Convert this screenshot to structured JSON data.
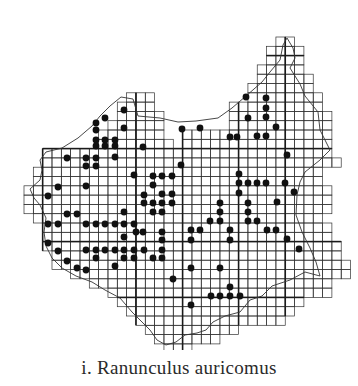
{
  "figure": {
    "caption": "i. Ranunculus auricomus",
    "ink_color": "#1a1a1a",
    "grid_color": "#333333",
    "dot_color": "#111111"
  },
  "grid": {
    "cell_w": 9.33,
    "cell_h": 9.3,
    "origin_x": 24,
    "origin_y": 37,
    "rows": [
      [
        [
          27,
          28
        ]
      ],
      [
        [
          26,
          29
        ]
      ],
      [
        [
          26,
          29
        ]
      ],
      [
        [
          25,
          29
        ]
      ],
      [
        [
          25,
          30
        ]
      ],
      [
        [
          24,
          30
        ]
      ],
      [
        [
          11,
          13
        ],
        [
          24,
          31
        ]
      ],
      [
        [
          10,
          13
        ],
        [
          22,
          31
        ]
      ],
      [
        [
          10,
          14
        ],
        [
          22,
          32
        ]
      ],
      [
        [
          9,
          14
        ],
        [
          22,
          32
        ]
      ],
      [
        [
          8,
          14
        ],
        [
          17,
          32
        ]
      ],
      [
        [
          8,
          15
        ],
        [
          17,
          32
        ]
      ],
      [
        [
          2,
          32
        ]
      ],
      [
        [
          2,
          33
        ]
      ],
      [
        [
          1,
          31
        ]
      ],
      [
        [
          1,
          31
        ]
      ],
      [
        [
          0,
          32
        ]
      ],
      [
        [
          0,
          32
        ]
      ],
      [
        [
          0,
          32
        ]
      ],
      [
        [
          1,
          31
        ]
      ],
      [
        [
          2,
          32
        ]
      ],
      [
        [
          2,
          32
        ]
      ],
      [
        [
          2,
          33
        ]
      ],
      [
        [
          3,
          33
        ]
      ],
      [
        [
          3,
          34
        ]
      ],
      [
        [
          5,
          34
        ]
      ],
      [
        [
          7,
          32
        ]
      ],
      [
        [
          9,
          32
        ]
      ],
      [
        [
          10,
          29
        ]
      ],
      [
        [
          11,
          28
        ]
      ],
      [
        [
          12,
          27
        ]
      ],
      [
        [
          13,
          22
        ]
      ],
      [
        [
          14,
          20
        ]
      ],
      [
        [
          15,
          17
        ]
      ]
    ],
    "bold_cols": [
      2,
      12,
      17,
      23,
      28
    ],
    "bold_rows": [
      2,
      12,
      22,
      28
    ]
  },
  "dots": [
    [
      246,
      97
    ],
    [
      266,
      98
    ],
    [
      266,
      108
    ],
    [
      266,
      117
    ],
    [
      248,
      118
    ],
    [
      276,
      127
    ],
    [
      257,
      136
    ],
    [
      266,
      136
    ],
    [
      230,
      137
    ],
    [
      237,
      137
    ],
    [
      287,
      155
    ],
    [
      182,
      129
    ],
    [
      200,
      128
    ],
    [
      124,
      110
    ],
    [
      105,
      118
    ],
    [
      96,
      123
    ],
    [
      124,
      128
    ],
    [
      96,
      130
    ],
    [
      96,
      140
    ],
    [
      105,
      140
    ],
    [
      115,
      140
    ],
    [
      96,
      146
    ],
    [
      105,
      146
    ],
    [
      115,
      146
    ],
    [
      115,
      157
    ],
    [
      143,
      147
    ],
    [
      86,
      158
    ],
    [
      96,
      158
    ],
    [
      67,
      158
    ],
    [
      86,
      166
    ],
    [
      96,
      166
    ],
    [
      134,
      175
    ],
    [
      153,
      176
    ],
    [
      162,
      176
    ],
    [
      172,
      176
    ],
    [
      153,
      185
    ],
    [
      144,
      195
    ],
    [
      162,
      194
    ],
    [
      172,
      194
    ],
    [
      144,
      203
    ],
    [
      153,
      203
    ],
    [
      162,
      203
    ],
    [
      172,
      203
    ],
    [
      153,
      212
    ],
    [
      162,
      212
    ],
    [
      181,
      165
    ],
    [
      58,
      187
    ],
    [
      48,
      196
    ],
    [
      86,
      186
    ],
    [
      67,
      214
    ],
    [
      77,
      214
    ],
    [
      48,
      224
    ],
    [
      58,
      224
    ],
    [
      86,
      224
    ],
    [
      96,
      224
    ],
    [
      105,
      224
    ],
    [
      115,
      224
    ],
    [
      124,
      224
    ],
    [
      134,
      224
    ],
    [
      124,
      212
    ],
    [
      136,
      232
    ],
    [
      143,
      232
    ],
    [
      162,
      232
    ],
    [
      162,
      240
    ],
    [
      162,
      250
    ],
    [
      48,
      243
    ],
    [
      58,
      251
    ],
    [
      67,
      261
    ],
    [
      77,
      268
    ],
    [
      86,
      270
    ],
    [
      124,
      237
    ],
    [
      86,
      250
    ],
    [
      96,
      250
    ],
    [
      105,
      250
    ],
    [
      115,
      250
    ],
    [
      124,
      250
    ],
    [
      134,
      250
    ],
    [
      144,
      250
    ],
    [
      124,
      258
    ],
    [
      134,
      258
    ],
    [
      96,
      258
    ],
    [
      115,
      266
    ],
    [
      153,
      258
    ],
    [
      162,
      258
    ],
    [
      239,
      174
    ],
    [
      239,
      183
    ],
    [
      248,
      183
    ],
    [
      257,
      183
    ],
    [
      266,
      183
    ],
    [
      239,
      193
    ],
    [
      220,
      203
    ],
    [
      220,
      212
    ],
    [
      210,
      221
    ],
    [
      220,
      221
    ],
    [
      248,
      203
    ],
    [
      248,
      212
    ],
    [
      248,
      221
    ],
    [
      257,
      221
    ],
    [
      277,
      202
    ],
    [
      285,
      183
    ],
    [
      294,
      192
    ],
    [
      191,
      230
    ],
    [
      200,
      230
    ],
    [
      191,
      240
    ],
    [
      230,
      230
    ],
    [
      230,
      240
    ],
    [
      267,
      230
    ],
    [
      276,
      230
    ],
    [
      287,
      239
    ],
    [
      299,
      249
    ],
    [
      173,
      279
    ],
    [
      191,
      268
    ],
    [
      220,
      268
    ],
    [
      230,
      287
    ],
    [
      211,
      296
    ],
    [
      220,
      296
    ],
    [
      230,
      296
    ],
    [
      240,
      296
    ],
    [
      191,
      305
    ]
  ],
  "boundary": [
    [
      287,
      38
    ],
    [
      293,
      48
    ],
    [
      295,
      58
    ],
    [
      290,
      68
    ],
    [
      300,
      84
    ],
    [
      305,
      96
    ],
    [
      318,
      112
    ],
    [
      320,
      130
    ],
    [
      330,
      150
    ],
    [
      320,
      160
    ],
    [
      305,
      172
    ],
    [
      300,
      182
    ],
    [
      297,
      195
    ],
    [
      296,
      215
    ],
    [
      302,
      232
    ],
    [
      310,
      248
    ],
    [
      316,
      262
    ],
    [
      320,
      276
    ],
    [
      305,
      272
    ],
    [
      290,
      280
    ],
    [
      272,
      286
    ],
    [
      262,
      296
    ],
    [
      250,
      300
    ],
    [
      240,
      312
    ],
    [
      225,
      316
    ],
    [
      213,
      322
    ],
    [
      206,
      330
    ],
    [
      197,
      333
    ],
    [
      185,
      335
    ],
    [
      176,
      342
    ],
    [
      166,
      345
    ],
    [
      157,
      340
    ],
    [
      150,
      330
    ],
    [
      142,
      322
    ],
    [
      132,
      312
    ],
    [
      120,
      298
    ],
    [
      105,
      290
    ],
    [
      92,
      282
    ],
    [
      76,
      276
    ],
    [
      62,
      268
    ],
    [
      52,
      258
    ],
    [
      46,
      246
    ],
    [
      44,
      232
    ],
    [
      46,
      218
    ],
    [
      40,
      205
    ],
    [
      34,
      198
    ],
    [
      30,
      189
    ],
    [
      40,
      180
    ],
    [
      42,
      170
    ],
    [
      40,
      160
    ],
    [
      46,
      152
    ],
    [
      62,
      148
    ],
    [
      78,
      138
    ],
    [
      92,
      126
    ],
    [
      100,
      116
    ],
    [
      110,
      106
    ],
    [
      121,
      97
    ],
    [
      133,
      99
    ],
    [
      138,
      116
    ],
    [
      160,
      118
    ],
    [
      178,
      122
    ],
    [
      196,
      121
    ],
    [
      218,
      118
    ],
    [
      232,
      108
    ],
    [
      246,
      96
    ],
    [
      262,
      82
    ],
    [
      270,
      72
    ],
    [
      280,
      60
    ],
    [
      283,
      45
    ],
    [
      287,
      38
    ]
  ]
}
